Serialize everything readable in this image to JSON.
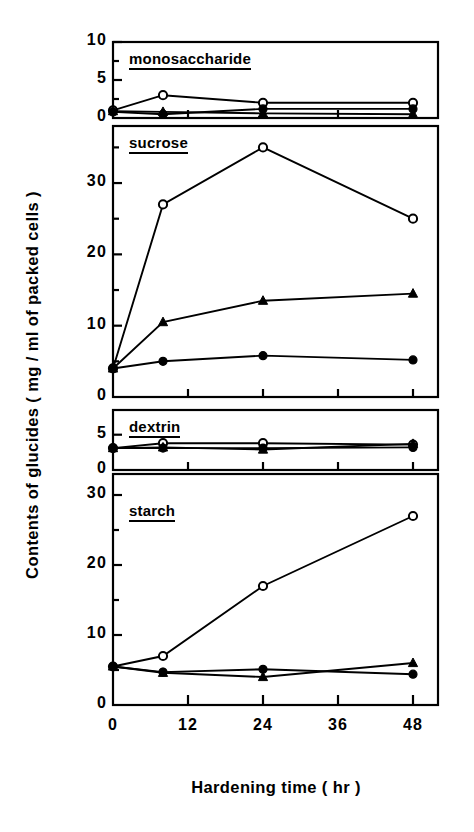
{
  "figure": {
    "ylabel": "Contents of glucides   ( mg / ml of packed cells )",
    "xlabel": "Hardening time    ( hr )"
  },
  "chart_data": {
    "type": "line",
    "title": "",
    "xlabel": "Hardening time ( hr )",
    "ylabel": "Contents of glucides ( mg / ml of packed cells )",
    "x": [
      0,
      8,
      24,
      48
    ],
    "xlim": [
      0,
      52
    ],
    "xticks": [
      0,
      12,
      24,
      36,
      48
    ],
    "xtick_labels": [
      "0",
      "12",
      "24",
      "36",
      "48"
    ],
    "grid": false,
    "legend": "none",
    "series_markers": [
      "open-circle",
      "filled-triangle",
      "filled-circle"
    ],
    "panels": [
      {
        "name": "monosaccharide",
        "label": "monosaccharide",
        "ylim": [
          0,
          10
        ],
        "yticks": [
          0,
          5,
          10
        ],
        "ytick_labels": [
          "0",
          "5",
          "10"
        ],
        "yminor": [
          2.5,
          7.5
        ],
        "series": [
          {
            "name": "open-circle",
            "marker": "open-circle",
            "values": [
              1.0,
              3.0,
              2.0,
              2.0
            ]
          },
          {
            "name": "filled-triangle",
            "marker": "filled-triangle",
            "values": [
              0.9,
              0.8,
              0.6,
              0.5
            ]
          },
          {
            "name": "filled-circle",
            "marker": "filled-circle",
            "values": [
              0.8,
              0.5,
              1.2,
              1.2
            ]
          }
        ]
      },
      {
        "name": "sucrose",
        "label": "sucrose",
        "ylim": [
          0,
          38
        ],
        "yticks": [
          0,
          10,
          20,
          30
        ],
        "ytick_labels": [
          "0",
          "10",
          "20",
          "30"
        ],
        "yminor": [
          5,
          15,
          25,
          35
        ],
        "series": [
          {
            "name": "open-circle",
            "marker": "open-circle",
            "values": [
              4.0,
              27.0,
              35.0,
              25.0
            ]
          },
          {
            "name": "filled-triangle",
            "marker": "filled-triangle",
            "values": [
              4.0,
              10.5,
              13.5,
              14.5
            ]
          },
          {
            "name": "filled-circle",
            "marker": "filled-circle",
            "values": [
              4.0,
              5.0,
              5.8,
              5.2
            ]
          }
        ]
      },
      {
        "name": "dextrin",
        "label": "dextrin",
        "ylim": [
          0,
          8.5
        ],
        "yticks": [
          0,
          5
        ],
        "ytick_labels": [
          "0",
          "5"
        ],
        "yminor": [],
        "series": [
          {
            "name": "open-circle",
            "marker": "open-circle",
            "values": [
              3.1,
              3.8,
              3.8,
              3.6
            ]
          },
          {
            "name": "filled-triangle",
            "marker": "filled-triangle",
            "values": [
              3.1,
              3.2,
              2.9,
              3.7
            ]
          },
          {
            "name": "filled-circle",
            "marker": "filled-circle",
            "values": [
              3.1,
              3.1,
              3.1,
              3.2
            ]
          }
        ]
      },
      {
        "name": "starch",
        "label": "starch",
        "ylim": [
          0,
          33
        ],
        "yticks": [
          0,
          10,
          20,
          30
        ],
        "ytick_labels": [
          "0",
          "10",
          "20",
          "30"
        ],
        "yminor": [
          5,
          15,
          25
        ],
        "series": [
          {
            "name": "open-circle",
            "marker": "open-circle",
            "values": [
              5.5,
              7.0,
              17.0,
              27.0
            ]
          },
          {
            "name": "filled-triangle",
            "marker": "filled-triangle",
            "values": [
              5.5,
              4.6,
              4.0,
              6.0
            ]
          },
          {
            "name": "filled-circle",
            "marker": "filled-circle",
            "values": [
              5.5,
              4.7,
              5.1,
              4.4
            ]
          }
        ]
      }
    ]
  },
  "panel_geometry": [
    {
      "top": 42,
      "bottom": 118
    },
    {
      "bottom_extra": 0
    }
  ]
}
